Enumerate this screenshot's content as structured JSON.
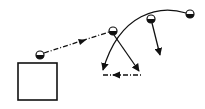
{
  "diagram": {
    "description": "Motion paths of balls: dash-dot projected path from ball near box, curved trajectory and falling paths",
    "colors": {
      "stroke": "#111111",
      "background": "#ffffff",
      "ball_fill_dark": "#111111",
      "ball_fill_light": "#ffffff"
    },
    "box": {
      "x": 18,
      "y": 63,
      "w": 39,
      "h": 37
    },
    "balls": [
      {
        "id": "ball-1",
        "cx": 40,
        "cy": 55,
        "r": 4
      },
      {
        "id": "ball-2",
        "cx": 113,
        "cy": 31,
        "r": 4
      },
      {
        "id": "ball-3",
        "cx": 151,
        "cy": 19,
        "r": 4
      },
      {
        "id": "ball-4",
        "cx": 190,
        "cy": 14,
        "r": 4
      }
    ],
    "paths": [
      {
        "id": "dashdot-launch",
        "style": "dash-dot",
        "from": [
          44,
          53
        ],
        "to": [
          109,
          32
        ],
        "arrow_at": [
          83,
          41
        ],
        "arrow_dir": "right"
      },
      {
        "id": "curved-trajectory",
        "style": "solid",
        "from": [
          186,
          13
        ],
        "to": [
          103,
          72
        ],
        "arrow": "end"
      },
      {
        "id": "fall-path-ball-2",
        "style": "solid",
        "from": [
          114,
          35
        ],
        "to": [
          139,
          72
        ],
        "arrow": "end"
      },
      {
        "id": "fall-path-ball-3",
        "style": "solid",
        "from": [
          152,
          23
        ],
        "to": [
          160,
          56
        ],
        "arrow": "end"
      },
      {
        "id": "dashdot-return",
        "style": "dash-dot",
        "from": [
          143,
          75
        ],
        "to": [
          102,
          75
        ],
        "arrow_at": [
          114,
          75
        ],
        "arrow_dir": "left"
      }
    ]
  }
}
